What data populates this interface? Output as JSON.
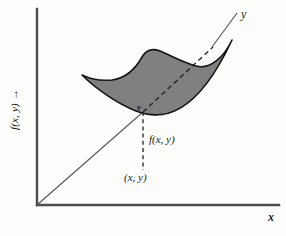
{
  "figure": {
    "labels": {
      "y_axis": "f(x, y) →",
      "x_axis": "x",
      "y_line": "y",
      "y_point": "y",
      "f_value": "f(x, y)",
      "point": "(x, y)"
    },
    "colors": {
      "surface_fill": "#808080",
      "surface_stroke": "#141414",
      "axis": "#4d4d4d",
      "line": "#5a5a5a",
      "dash": "#1f1f1f",
      "background": "#fdfdfc"
    },
    "geometry": {
      "origin": [
        37,
        205
      ],
      "y_axis_top": [
        37,
        9
      ],
      "x_axis_right": [
        279,
        205
      ],
      "diagonal_start": [
        37,
        205
      ],
      "diagonal_end": [
        236,
        13
      ],
      "surface_point": [
        143,
        112
      ],
      "dashed_drop_end": [
        143,
        170
      ]
    }
  }
}
